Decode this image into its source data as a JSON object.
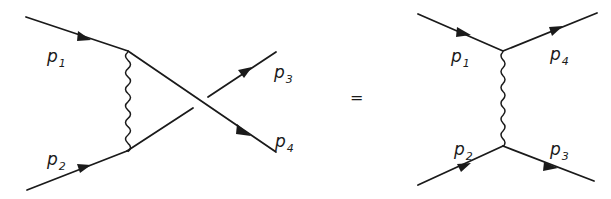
{
  "diagram": {
    "type": "feynman-diagram-equation",
    "equals_sign": "=",
    "left": {
      "name": "crossed-diagram",
      "labels": {
        "p1": {
          "main": "p",
          "sub": "1"
        },
        "p2": {
          "main": "p",
          "sub": "2"
        },
        "p3": {
          "main": "p",
          "sub": "3"
        },
        "p4": {
          "main": "p",
          "sub": "4"
        }
      }
    },
    "right": {
      "name": "exchange-diagram",
      "labels": {
        "p1": {
          "main": "p",
          "sub": "1"
        },
        "p2": {
          "main": "p",
          "sub": "2"
        },
        "p3": {
          "main": "p",
          "sub": "3"
        },
        "p4": {
          "main": "p",
          "sub": "4"
        }
      }
    }
  }
}
